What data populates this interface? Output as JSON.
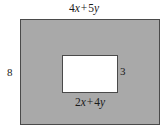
{
  "figure": {
    "type": "geometry-diagram",
    "canvas": {
      "width": 168,
      "height": 135,
      "background": "#ffffff"
    },
    "outer_rectangle": {
      "name": "outer-rectangle",
      "fill": "#a9a9a9",
      "stroke": "#4a4a4a",
      "top_label": "4x + 5y",
      "left_label": "8"
    },
    "inner_rectangle": {
      "name": "inner-rectangle",
      "fill": "#ffffff",
      "stroke": "#4a4a4a",
      "bottom_label": "2x + 4y",
      "right_label": "3"
    },
    "labels": {
      "top": {
        "coefficient_1": "4",
        "variable_1": "x",
        "operator": "+",
        "coefficient_2": "5",
        "variable_2": "y",
        "full": "4x + 5y"
      },
      "bottom": {
        "coefficient_1": "2",
        "variable_1": "x",
        "operator": "+",
        "coefficient_2": "4",
        "variable_2": "y",
        "full": "2x + 4y"
      },
      "left": {
        "full": "8"
      },
      "right": {
        "full": "3"
      }
    }
  }
}
